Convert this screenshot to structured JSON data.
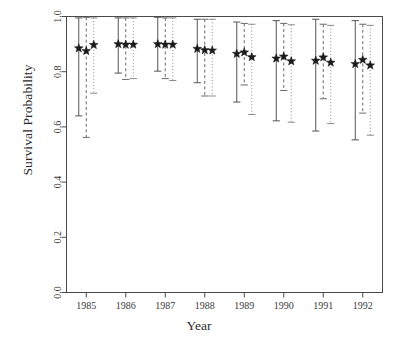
{
  "chart_data": {
    "type": "scatter",
    "title": "",
    "xlabel": "Year",
    "ylabel": "Survival Probability",
    "grid": false,
    "legend": "none",
    "ylim": [
      0.0,
      1.0
    ],
    "ytick_labels": [
      "0.0",
      "0.2",
      "0.4",
      "0.6",
      "0.8",
      "1.0"
    ],
    "ytick_values": [
      0.0,
      0.2,
      0.4,
      0.6,
      0.8,
      1.0
    ],
    "categories": [
      "1985",
      "1986",
      "1987",
      "1988",
      "1989",
      "1990",
      "1991",
      "1992"
    ],
    "x": [
      1985,
      1986,
      1987,
      1988,
      1989,
      1990,
      1991,
      1992
    ],
    "marker": "star",
    "error_bar_style": "vertical-with-caps",
    "series": [
      {
        "name": "estimate-1",
        "line_style": "solid",
        "values": [
          0.885,
          0.9,
          0.9,
          0.883,
          0.865,
          0.848,
          0.84,
          0.828
        ],
        "lower": [
          0.64,
          0.795,
          0.802,
          0.76,
          0.69,
          0.622,
          0.585,
          0.553
        ],
        "upper": [
          0.995,
          0.995,
          0.997,
          0.99,
          0.98,
          0.985,
          0.99,
          0.985
        ]
      },
      {
        "name": "estimate-2",
        "line_style": "dashed",
        "values": [
          0.875,
          0.898,
          0.898,
          0.878,
          0.87,
          0.855,
          0.852,
          0.843
        ],
        "lower": [
          0.562,
          0.772,
          0.775,
          0.712,
          0.752,
          0.732,
          0.702,
          0.65
        ],
        "upper": [
          0.997,
          0.995,
          0.995,
          0.99,
          0.975,
          0.975,
          0.972,
          0.972
        ]
      },
      {
        "name": "estimate-3",
        "line_style": "dotted",
        "values": [
          0.897,
          0.898,
          0.898,
          0.877,
          0.853,
          0.838,
          0.833,
          0.823
        ],
        "lower": [
          0.722,
          0.775,
          0.768,
          0.712,
          0.645,
          0.617,
          0.612,
          0.57
        ],
        "upper": [
          0.995,
          0.995,
          0.995,
          0.99,
          0.972,
          0.97,
          0.968,
          0.968
        ]
      }
    ]
  },
  "axes": {
    "y_title": "Survival Probability",
    "x_title": "Year"
  }
}
